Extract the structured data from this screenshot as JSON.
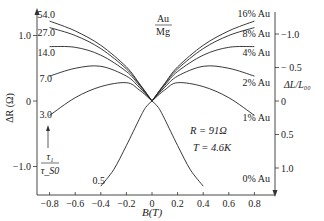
{
  "chart_data": {
    "type": "line",
    "title": "",
    "inset_label": {
      "numerator": "Au",
      "denominator": "Mg"
    },
    "xlabel": "B(T)",
    "ylabel_left": "ΔR (Ω)",
    "ylabel_right": "ΔL/L₀₀",
    "xlim": [
      -0.9,
      0.95
    ],
    "ylim_left": [
      -1.45,
      1.45
    ],
    "right_axis_inverted": true,
    "x_ticks": [
      -0.8,
      -0.6,
      -0.4,
      -0.2,
      0,
      0.2,
      0.4,
      0.6,
      0.8
    ],
    "x_tick_labels": [
      "−0.8",
      "−0.6",
      "−0.4",
      "−0.2",
      "0",
      "0.2",
      "0.4",
      "0.6",
      "0.8"
    ],
    "y_left_ticks": [
      1.0,
      0,
      -1.0
    ],
    "y_left_tick_labels": [
      "1.0",
      "0",
      "−1.0"
    ],
    "y_right_ticks": [
      -1.0,
      -0.5,
      0,
      0.5,
      1.0
    ],
    "y_right_tick_labels": [
      "−1.0",
      "− 0.5",
      "0",
      "0.5",
      "1.0"
    ],
    "annotations": {
      "R": "R = 91Ω",
      "T": "T = 4.6K",
      "ratio_numerator": "τ₁",
      "ratio_denominator": "τ_S0"
    },
    "series": [
      {
        "name": "16% Au",
        "left_label": "54.0",
        "x": [
          -0.8,
          -0.6,
          -0.4,
          -0.2,
          -0.1,
          0,
          0.1,
          0.2,
          0.4,
          0.6,
          0.8
        ],
        "y": [
          1.22,
          1.07,
          0.85,
          0.52,
          0.27,
          0,
          0.27,
          0.52,
          0.85,
          1.07,
          1.22
        ]
      },
      {
        "name": "8% Au",
        "left_label": "27.0",
        "x": [
          -0.8,
          -0.6,
          -0.4,
          -0.2,
          -0.1,
          0,
          0.1,
          0.2,
          0.4,
          0.6,
          0.8
        ],
        "y": [
          1.12,
          1.0,
          0.8,
          0.49,
          0.26,
          0,
          0.26,
          0.49,
          0.8,
          1.0,
          1.12
        ]
      },
      {
        "name": "4% Au",
        "left_label": "14.0",
        "x": [
          -0.8,
          -0.6,
          -0.4,
          -0.2,
          -0.1,
          0,
          0.1,
          0.2,
          0.4,
          0.6,
          0.8
        ],
        "y": [
          0.83,
          0.82,
          0.7,
          0.45,
          0.24,
          0,
          0.24,
          0.45,
          0.7,
          0.82,
          0.83
        ]
      },
      {
        "name": "2% Au",
        "left_label": "7.0",
        "x": [
          -0.8,
          -0.6,
          -0.4,
          -0.2,
          -0.1,
          0,
          0.1,
          0.2,
          0.4,
          0.6,
          0.8
        ],
        "y": [
          0.38,
          0.5,
          0.53,
          0.38,
          0.21,
          0,
          0.21,
          0.38,
          0.53,
          0.5,
          0.38
        ]
      },
      {
        "name": "1% Au",
        "left_label": "3.0",
        "x": [
          -0.8,
          -0.6,
          -0.4,
          -0.2,
          -0.1,
          0,
          0.1,
          0.2,
          0.4,
          0.6,
          0.8
        ],
        "y": [
          -0.22,
          0.05,
          0.22,
          0.28,
          0.17,
          0,
          0.17,
          0.28,
          0.22,
          0.05,
          -0.22
        ]
      },
      {
        "name": "0% Au",
        "left_label": "0.5",
        "x": [
          -0.4,
          -0.3,
          -0.2,
          -0.1,
          -0.05,
          0,
          0.05,
          0.1,
          0.2,
          0.3,
          0.4
        ],
        "y": [
          -1.3,
          -1.05,
          -0.68,
          -0.28,
          -0.1,
          0,
          -0.1,
          -0.28,
          -0.68,
          -1.05,
          -1.3
        ]
      }
    ]
  }
}
